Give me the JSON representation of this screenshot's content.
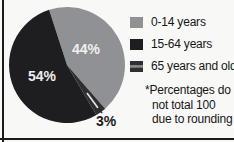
{
  "figure": {
    "note_lines": [
      "*Percentages do",
      "not total 100",
      "due to rounding"
    ]
  },
  "chart_data": {
    "type": "pie",
    "title": "",
    "slices": [
      {
        "label": "0-14 years",
        "value": 44,
        "display": "44%",
        "color": "#909194",
        "label_color": "#f0efed"
      },
      {
        "label": "15-64 years",
        "value": 54,
        "display": "54%",
        "color": "#1e1e20",
        "label_color": "#efeeec"
      },
      {
        "label": "65 years and older",
        "value": 3,
        "display": "3%",
        "color": "#2f2f31",
        "label_color": "#1b1b1b"
      }
    ],
    "start_angle_deg": -18,
    "draw_order": [
      0,
      2,
      1
    ],
    "legend_position": "right",
    "note": "*Percentages do not total 100 due to rounding",
    "colors": {
      "background": "#f8f8f6",
      "frame": "#1a1a1a",
      "legend_text": "#161616",
      "swatch_stripe": "#8c8c8c",
      "leader_inner": "#e8e8e6",
      "leader_outer": "#2a2a2a"
    }
  }
}
